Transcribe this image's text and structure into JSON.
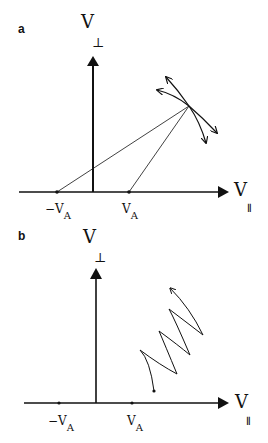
{
  "panels": [
    {
      "label": "a",
      "y_axis_label": "V",
      "y_axis_sub": "⊥",
      "x_axis_label": "V",
      "x_axis_sub": "∥",
      "ticks": [
        {
          "label": "−V",
          "sub": "A"
        },
        {
          "label": "V",
          "sub": "A"
        }
      ]
    },
    {
      "label": "b",
      "y_axis_label": "V",
      "y_axis_sub": "⊥",
      "x_axis_label": "V",
      "x_axis_sub": "∥",
      "ticks": [
        {
          "label": "−V",
          "sub": "A"
        },
        {
          "label": "V",
          "sub": "A"
        }
      ]
    }
  ],
  "colors": {
    "ink": "#111111",
    "background": "#ffffff"
  }
}
